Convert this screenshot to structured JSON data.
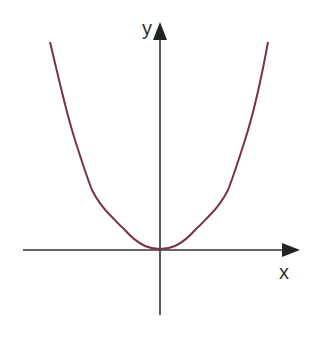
{
  "diagram": {
    "type": "function-graph",
    "axes": {
      "x_label": "x",
      "y_label": "y",
      "color": "#333333"
    },
    "curve": {
      "description": "U-shaped even-power curve (parabola-like, flat near origin) with vertex at the origin",
      "color": "#7a3050"
    }
  }
}
